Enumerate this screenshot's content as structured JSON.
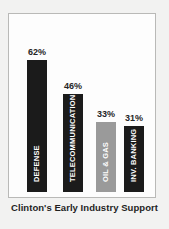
{
  "chart_data": {
    "type": "bar",
    "title": "Clinton's Early Industry Support",
    "xlabel": "",
    "ylabel": "",
    "ylim": [
      0,
      70
    ],
    "grid": false,
    "legend": "none",
    "categories": [
      "DEFENSE",
      "TELECOMMUNICATIONS",
      "OIL & GAS",
      "INV. BANKING"
    ],
    "values": [
      62,
      46,
      33,
      31
    ],
    "value_labels": [
      "62%",
      "46%",
      "33%",
      "31%"
    ],
    "bar_colors": [
      "#1b1b1b",
      "#1b1b1b",
      "#9a9a9a",
      "#1b1b1b"
    ],
    "bars": [
      {
        "category": "DEFENSE",
        "value": 62,
        "value_label": "62%",
        "color": "#1b1b1b",
        "style": "dark"
      },
      {
        "category": "TELECOMMUNICATIONS",
        "value": 46,
        "value_label": "46%",
        "color": "#1b1b1b",
        "style": "dark"
      },
      {
        "category": "OIL & GAS",
        "value": 33,
        "value_label": "33%",
        "color": "#9a9a9a",
        "style": "gray"
      },
      {
        "category": "INV. BANKING",
        "value": 31,
        "value_label": "31%",
        "color": "#1b1b1b",
        "style": "dark"
      }
    ]
  },
  "caption": "Clinton's Early Industry Support",
  "colors": {
    "page_background": "#f2f2f1",
    "frame_background": "#fdfdfd",
    "frame_border": "#b9b9b7",
    "bar_dark": "#1b1b1b",
    "bar_gray": "#9a9a9a",
    "value_text": "#262626",
    "bar_label_text": "#ffffff",
    "caption_text": "#1f1f1f"
  }
}
